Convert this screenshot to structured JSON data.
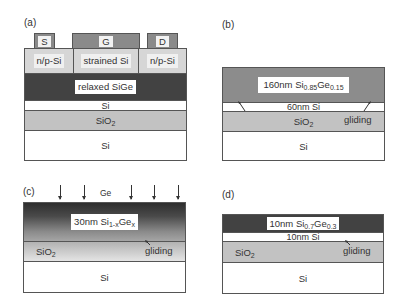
{
  "panels": {
    "a": {
      "label": "(a)",
      "contacts": {
        "source": "S",
        "gate": "G",
        "drain": "D"
      },
      "top_layer": {
        "left": "n/p-Si",
        "center": "strained Si",
        "right": "n/p-Si"
      },
      "layers": {
        "buffer": "relaxed SiGe",
        "si_thin": "Si",
        "oxide": "SiO",
        "oxide_sub": "2",
        "substrate": "Si"
      }
    },
    "b": {
      "label": "(b)",
      "layers": {
        "sige_prefix": "160nm Si",
        "sige_si_sub": "0.85",
        "sige_ge": "Ge",
        "sige_ge_sub": "0.15",
        "si_thin": "60nm Si",
        "oxide": "SiO",
        "oxide_sub": "2",
        "substrate": "Si"
      },
      "annotation": "gliding"
    },
    "c": {
      "label": "(c)",
      "arrow_label": "Ge",
      "arrow_count": 5,
      "layers": {
        "sige_prefix": "30nm Si",
        "sige_si_sub": "1-x",
        "sige_ge": "Ge",
        "sige_ge_sub": "x",
        "oxide": "SiO",
        "oxide_sub": "2",
        "substrate": "Si"
      },
      "annotation": "gliding"
    },
    "d": {
      "label": "(d)",
      "layers": {
        "sige_prefix": "10nm Si",
        "sige_si_sub": "0.7",
        "sige_ge": "Ge",
        "sige_ge_sub": "0.3",
        "si_thin": "10nm Si",
        "oxide": "SiO",
        "oxide_sub": "2",
        "substrate": "Si"
      },
      "annotation": "gliding"
    }
  },
  "colors": {
    "relaxed_sige": "#424242",
    "sige_b": "#8c8c8c",
    "oxide": "#c2c2c2",
    "top_layer": "#d6d6d6",
    "contact": "#8a8a8a",
    "border": "#555555"
  }
}
